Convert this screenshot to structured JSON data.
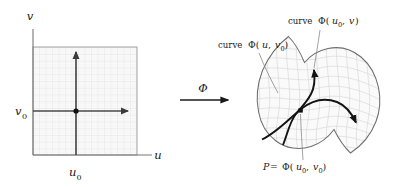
{
  "figure": {
    "colors": {
      "axis": "#555555",
      "grid": "#d9d9d9",
      "domain_border": "#8c8c8c",
      "bold_curve": "#1a1a1a",
      "surface_outline": "#6e6e6e",
      "surface_mesh": "#cfcfcf",
      "text": "#1a1a1a",
      "background": "#ffffff"
    },
    "domain_panel": {
      "axis_label_v": "v",
      "axis_label_u": "u",
      "tick_label_u0": "u",
      "tick_label_u0_sub": "0",
      "tick_label_v0": "v",
      "tick_label_v0_sub": "0",
      "grid_visible": true,
      "point_marker": "dot"
    },
    "map_arrow": {
      "label": "Φ",
      "direction": "right"
    },
    "surface_panel": {
      "label_curve_u": {
        "prefix": "curve ",
        "phi": "Φ(",
        "arg1": "u",
        "arg1_sub": "",
        "sep": ", ",
        "arg2": "v",
        "arg2_sub": "0",
        "suffix": ")",
        "full_text": "curve Φ(u, v0)"
      },
      "label_curve_v": {
        "prefix": "curve ",
        "phi": "Φ(",
        "arg1": "u",
        "arg1_sub": "0",
        "sep": ", ",
        "arg2": "v",
        "arg2_sub": "",
        "suffix": ")",
        "full_text": "curve Φ(u0, v)"
      },
      "label_point": {
        "p": "P",
        "equals": " = ",
        "phi": "Φ(",
        "arg1": "u",
        "arg1_sub": "0",
        "sep": ", ",
        "arg2": "v",
        "arg2_sub": "0",
        "suffix": ")",
        "full_text": "P = Φ(u0, v0)"
      },
      "mesh_visible": true,
      "point_marker": "square"
    }
  }
}
